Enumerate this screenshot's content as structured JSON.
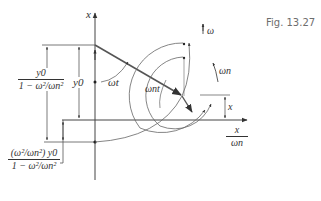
{
  "figure": {
    "caption": "Fig. 13.27",
    "axes": {
      "vertical_label": "x",
      "horizontal_label_num": "x",
      "horizontal_label_den": "ωn"
    },
    "labels": {
      "omega_t": "ωt",
      "omega_n_t": "ωnt",
      "omega": "ω",
      "omega_n": "ωn",
      "y0": "y0",
      "x_dim": "x"
    },
    "left_fraction_top": {
      "numerator": "y0",
      "denominator": "1 − ω²/ωn²"
    },
    "left_fraction_bottom": {
      "numerator": "(ω²/ωn²) y0",
      "denominator": "1 − ω²/ωn²"
    }
  }
}
